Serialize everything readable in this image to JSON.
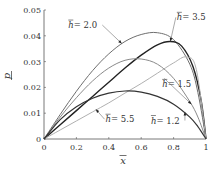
{
  "chart_data": {
    "type": "line",
    "title": "",
    "xlabel": "x̄",
    "ylabel": "p̄",
    "xlim": [
      0,
      1
    ],
    "ylim": [
      0,
      0.05
    ],
    "grid": false,
    "legend_position": "inline-annotations",
    "x_ticks": [
      "0",
      "0.2",
      "0.4",
      "0.6",
      "0.8",
      "1"
    ],
    "y_ticks": [
      "0",
      "0.01",
      "0.02",
      "0.03",
      "0.04",
      "0.05"
    ],
    "series": [
      {
        "name": "h̄ = 2.0",
        "color": "#6e6e6e",
        "width": 1.0,
        "x": [
          0,
          0.1,
          0.2,
          0.3,
          0.4,
          0.5,
          0.6,
          0.7,
          0.8,
          0.9,
          0.95,
          1.0
        ],
        "y": [
          0,
          0.0095,
          0.0185,
          0.0265,
          0.033,
          0.0378,
          0.0405,
          0.0412,
          0.0385,
          0.029,
          0.018,
          0
        ]
      },
      {
        "name": "h̄ = 3.5",
        "color": "#222222",
        "width": 1.4,
        "x": [
          0,
          0.1,
          0.2,
          0.3,
          0.4,
          0.5,
          0.6,
          0.7,
          0.78,
          0.85,
          0.92,
          0.97,
          1.0
        ],
        "y": [
          0,
          0.0055,
          0.011,
          0.0165,
          0.022,
          0.0275,
          0.0325,
          0.0365,
          0.0378,
          0.036,
          0.028,
          0.015,
          0
        ]
      },
      {
        "name": "h̄ = 1.5",
        "color": "#8a8a8a",
        "width": 1.0,
        "x": [
          0,
          0.1,
          0.2,
          0.3,
          0.4,
          0.5,
          0.6,
          0.7,
          0.8,
          0.9,
          0.95,
          1.0
        ],
        "y": [
          0,
          0.0085,
          0.016,
          0.0225,
          0.0275,
          0.0305,
          0.031,
          0.029,
          0.0235,
          0.0145,
          0.0085,
          0
        ]
      },
      {
        "name": "h̄ = 5.5",
        "color": "#b0b0b0",
        "width": 1.0,
        "x": [
          0,
          0.1,
          0.2,
          0.3,
          0.4,
          0.5,
          0.6,
          0.7,
          0.8,
          0.88,
          0.94,
          1.0
        ],
        "y": [
          0,
          0.0035,
          0.007,
          0.0105,
          0.014,
          0.0178,
          0.0215,
          0.0255,
          0.0295,
          0.0318,
          0.027,
          0
        ]
      },
      {
        "name": "h̄ = 1.2",
        "color": "#333333",
        "width": 1.2,
        "x": [
          0,
          0.1,
          0.2,
          0.3,
          0.4,
          0.5,
          0.6,
          0.7,
          0.8,
          0.9,
          0.95,
          1.0
        ],
        "y": [
          0,
          0.0075,
          0.0125,
          0.0158,
          0.0178,
          0.0186,
          0.0182,
          0.0165,
          0.0135,
          0.0085,
          0.0048,
          0
        ]
      }
    ],
    "annotations": [
      {
        "text": "h̄ = 2.0",
        "label_x": 0.15,
        "label_y": 0.043,
        "arrow_to_x": 0.48,
        "arrow_to_y": 0.037
      },
      {
        "text": "h̄ = 3.5",
        "label_x": 0.82,
        "label_y": 0.046,
        "arrow_to_x": 0.78,
        "arrow_to_y": 0.0378
      },
      {
        "text": "h̄ = 1.5",
        "label_x": 0.73,
        "label_y": 0.02,
        "arrow_to_x": 0.91,
        "arrow_to_y": 0.0135
      },
      {
        "text": "h̄ = 5.5",
        "label_x": 0.38,
        "label_y": 0.0065,
        "arrow_to_x": 0.32,
        "arrow_to_y": 0.0115
      },
      {
        "text": "h̄ = 1.2",
        "label_x": 0.66,
        "label_y": 0.006,
        "arrow_to_x": 0.87,
        "arrow_to_y": 0.0105
      }
    ]
  },
  "labels": {
    "x_axis": "x",
    "y_axis": "p",
    "ann_2_0": "= 2.0",
    "ann_3_5": "= 3.5",
    "ann_1_5": "= 1.5",
    "ann_5_5": "= 5.5",
    "ann_1_2": "= 1.2",
    "h": "h"
  }
}
